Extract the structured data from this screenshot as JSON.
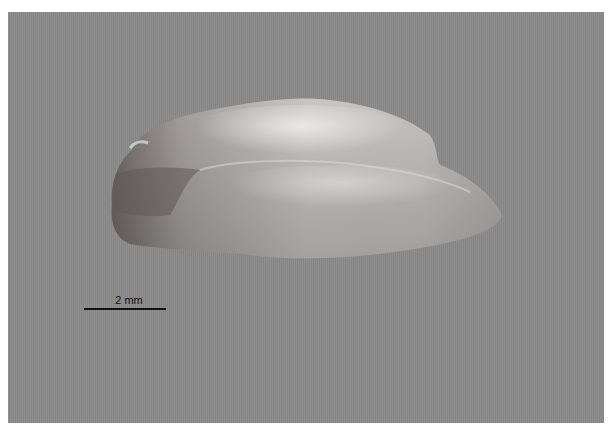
{
  "image": {
    "subject": "translucent shell/otolith specimen on gray background",
    "background_color": "#8a8a8a"
  },
  "scale_bar": {
    "label": "2 mm"
  }
}
